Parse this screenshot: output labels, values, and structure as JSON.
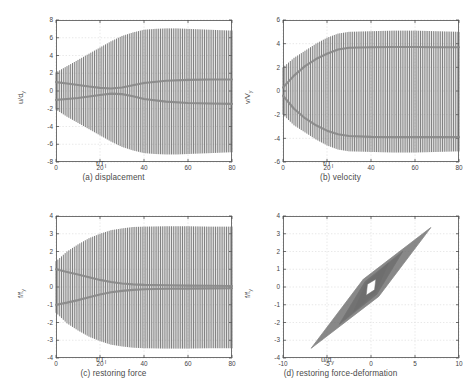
{
  "figure": {
    "background_color": "#ffffff",
    "trace_color": "#6e6e6e",
    "envelope_color": "#8a8a8a",
    "axis_color": "#4d4d4d",
    "grid_color": "#d9d9d9",
    "tick_font_size": 6.4
  },
  "panels": [
    {
      "id": "a",
      "caption": "(a) displacement",
      "xlabel_main": "t/T",
      "xlabel_sub": "I",
      "ylabel_main": "u/d",
      "ylabel_sub": "y"
    },
    {
      "id": "b",
      "caption": "(b) velocity",
      "xlabel_main": "t/T",
      "xlabel_sub": "I",
      "ylabel_main": "v/V",
      "ylabel_sub": "y"
    },
    {
      "id": "c",
      "caption": "(c) restoring force",
      "xlabel_main": "t/T",
      "xlabel_sub": "I",
      "ylabel_main": "f/f",
      "ylabel_sub": "y"
    },
    {
      "id": "d",
      "caption": "(d) restoring force-deformation",
      "xlabel_main": "u/d",
      "xlabel_sub": "y",
      "ylabel_main": "f/f",
      "ylabel_sub": "y"
    }
  ],
  "chart_data": [
    {
      "type": "line",
      "panel": "a",
      "title": "(a) displacement",
      "xlabel": "t/T_I",
      "ylabel": "u/d_y",
      "xlim": [
        0,
        80
      ],
      "ylim": [
        -8,
        8
      ],
      "xticks": [
        0,
        20,
        40,
        60,
        80
      ],
      "yticks": [
        -8,
        -6,
        -4,
        -2,
        0,
        2,
        4,
        6,
        8
      ],
      "grid": true,
      "description": "Densely oscillating normalized displacement time history whose amplitude envelope grows from about 2 at t/T_I=0 to about 7 by t/T_I=40 and then stays nearly constant out to t/T_I=80. Two inner mean-drift envelope traces start at about +1 and -1, pinch toward 0 near t/T_I=20-30 and then spread out to about +1.3 and -1.4.",
      "series": [
        {
          "name": "upper-envelope",
          "x": [
            0,
            5,
            10,
            15,
            20,
            25,
            30,
            35,
            40,
            45,
            50,
            55,
            60,
            65,
            70,
            75,
            80
          ],
          "values": [
            2.1,
            2.8,
            3.5,
            4.2,
            4.9,
            5.6,
            6.2,
            6.6,
            6.9,
            7.0,
            7.05,
            7.05,
            7.0,
            6.95,
            6.9,
            6.85,
            6.8
          ]
        },
        {
          "name": "lower-envelope",
          "x": [
            0,
            5,
            10,
            15,
            20,
            25,
            30,
            35,
            40,
            45,
            50,
            55,
            60,
            65,
            70,
            75,
            80
          ],
          "values": [
            -2.1,
            -2.9,
            -3.6,
            -4.3,
            -5.0,
            -5.7,
            -6.3,
            -6.7,
            -7.0,
            -7.1,
            -7.15,
            -7.15,
            -7.1,
            -7.05,
            -7.0,
            -6.95,
            -6.9
          ]
        },
        {
          "name": "inner-upper-drift",
          "x": [
            0,
            5,
            10,
            15,
            20,
            25,
            30,
            35,
            40,
            50,
            60,
            70,
            80
          ],
          "values": [
            1.0,
            0.85,
            0.68,
            0.5,
            0.35,
            0.28,
            0.4,
            0.65,
            0.9,
            1.15,
            1.25,
            1.3,
            1.3
          ]
        },
        {
          "name": "inner-lower-drift",
          "x": [
            0,
            5,
            10,
            15,
            20,
            25,
            30,
            35,
            40,
            50,
            60,
            70,
            80
          ],
          "values": [
            -1.0,
            -0.9,
            -0.78,
            -0.62,
            -0.45,
            -0.3,
            -0.35,
            -0.6,
            -0.9,
            -1.2,
            -1.35,
            -1.4,
            -1.45
          ]
        }
      ]
    },
    {
      "type": "line",
      "panel": "b",
      "title": "(b) velocity",
      "xlabel": "t/T_I",
      "ylabel": "v/V_y",
      "xlim": [
        0,
        80
      ],
      "ylim": [
        -6,
        6
      ],
      "xticks": [
        0,
        20,
        40,
        60,
        80
      ],
      "yticks": [
        -6,
        -4,
        -2,
        0,
        2,
        4,
        6
      ],
      "grid": true,
      "description": "Normalized velocity time history. Oscillation amplitude envelope rises from about 2 at the start to about 5 after t/T_I=30 and holds flat. Two strong inner traces rise/fall from 0 to a plateau of about +3.7 and -3.9 by t/T_I=30.",
      "series": [
        {
          "name": "upper-envelope",
          "x": [
            0,
            5,
            10,
            15,
            20,
            25,
            30,
            40,
            50,
            60,
            70,
            80
          ],
          "values": [
            2.0,
            2.8,
            3.4,
            4.0,
            4.5,
            4.85,
            5.0,
            5.05,
            5.1,
            5.1,
            5.05,
            5.0
          ]
        },
        {
          "name": "lower-envelope",
          "x": [
            0,
            5,
            10,
            15,
            20,
            25,
            30,
            40,
            50,
            60,
            70,
            80
          ],
          "values": [
            -2.0,
            -2.9,
            -3.5,
            -4.1,
            -4.6,
            -4.95,
            -5.1,
            -5.15,
            -5.2,
            -5.2,
            -5.15,
            -5.1
          ]
        },
        {
          "name": "inner-upper-plateau",
          "x": [
            0,
            5,
            10,
            15,
            20,
            25,
            30,
            40,
            50,
            60,
            70,
            80
          ],
          "values": [
            0.3,
            1.3,
            2.1,
            2.7,
            3.15,
            3.5,
            3.65,
            3.7,
            3.72,
            3.72,
            3.7,
            3.7
          ]
        },
        {
          "name": "inner-lower-plateau",
          "x": [
            0,
            5,
            10,
            15,
            20,
            25,
            30,
            40,
            50,
            60,
            70,
            80
          ],
          "values": [
            -0.4,
            -1.5,
            -2.3,
            -2.9,
            -3.35,
            -3.65,
            -3.8,
            -3.88,
            -3.9,
            -3.9,
            -3.9,
            -3.9
          ]
        }
      ]
    },
    {
      "type": "line",
      "panel": "c",
      "title": "(c) restoring force",
      "xlabel": "t/T_I",
      "ylabel": "f/f_y",
      "xlim": [
        0,
        80
      ],
      "ylim": [
        -4,
        4
      ],
      "xticks": [
        0,
        20,
        40,
        60,
        80
      ],
      "yticks": [
        -4,
        -3,
        -2,
        -1,
        0,
        1,
        2,
        3,
        4
      ],
      "grid": true,
      "description": "Normalized restoring force time history. Oscillation envelope grows from about 1.4 to a saturated plateau of about 3.4 by t/T_I=35 and stays flat to t/T_I=80. Two inner traces start at about +1 and -1 and converge toward 0 by t/T_I=35, remaining near zero afterwards.",
      "series": [
        {
          "name": "upper-envelope",
          "x": [
            0,
            5,
            10,
            15,
            20,
            25,
            30,
            35,
            40,
            50,
            60,
            70,
            80
          ],
          "values": [
            1.45,
            2.0,
            2.4,
            2.75,
            3.0,
            3.2,
            3.3,
            3.38,
            3.4,
            3.42,
            3.42,
            3.4,
            3.4
          ]
        },
        {
          "name": "lower-envelope",
          "x": [
            0,
            5,
            10,
            15,
            20,
            25,
            30,
            35,
            40,
            50,
            60,
            70,
            80
          ],
          "values": [
            -1.45,
            -2.05,
            -2.45,
            -2.8,
            -3.05,
            -3.25,
            -3.35,
            -3.42,
            -3.45,
            -3.47,
            -3.47,
            -3.45,
            -3.45
          ]
        },
        {
          "name": "inner-upper-drift",
          "x": [
            0,
            5,
            10,
            15,
            20,
            25,
            30,
            35,
            40,
            50,
            60,
            70,
            80
          ],
          "values": [
            1.0,
            0.85,
            0.7,
            0.55,
            0.4,
            0.28,
            0.2,
            0.15,
            0.12,
            0.1,
            0.08,
            0.07,
            0.06
          ]
        },
        {
          "name": "inner-lower-drift",
          "x": [
            0,
            5,
            10,
            15,
            20,
            25,
            30,
            35,
            40,
            50,
            60,
            70,
            80
          ],
          "values": [
            -1.0,
            -0.88,
            -0.74,
            -0.58,
            -0.42,
            -0.3,
            -0.22,
            -0.16,
            -0.13,
            -0.1,
            -0.09,
            -0.08,
            -0.07
          ]
        }
      ]
    },
    {
      "type": "line",
      "panel": "d",
      "title": "(d) restoring force-deformation",
      "xlabel": "u/d_y",
      "ylabel": "f/f_y",
      "xlim": [
        -10,
        10
      ],
      "ylim": [
        -4,
        4
      ],
      "xticks": [
        -10,
        -5,
        0,
        5,
        10
      ],
      "yticks": [
        -4,
        -3,
        -2,
        -1,
        0,
        1,
        2,
        3,
        4
      ],
      "grid": true,
      "description": "Hysteresis loops of normalized restoring force against normalized deformation. Loops are elongated, narrow parallelogram shapes inclined along a positive slope, nested about the origin. The largest outer loop reaches about (6.8, 3.35) at the upper-right tip and about (-6.8, -3.45) at the lower-left tip. Smaller inner loops near the origin span roughly +/-2 in u/d_y and +/-1.3 in f/f_y.",
      "loops": [
        {
          "name": "outer-loop",
          "tip_max": [
            6.8,
            3.35
          ],
          "tip_min": [
            -6.8,
            -3.45
          ],
          "width": 1.6
        },
        {
          "name": "mid-loop",
          "tip_max": [
            3.6,
            2.0
          ],
          "tip_min": [
            -3.6,
            -2.1
          ],
          "width": 1.2
        },
        {
          "name": "inner-loop",
          "tip_max": [
            2.0,
            1.35
          ],
          "tip_min": [
            -2.0,
            -1.4
          ],
          "width": 0.9
        },
        {
          "name": "small-loop",
          "tip_max": [
            1.0,
            0.8
          ],
          "tip_min": [
            -1.0,
            -0.85
          ],
          "width": 0.5
        }
      ]
    }
  ]
}
